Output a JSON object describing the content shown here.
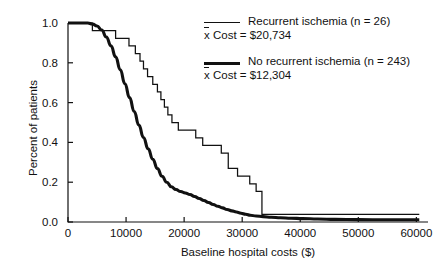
{
  "chart_data": {
    "type": "line",
    "title": "",
    "xlabel": "Baseline hospital costs ($)",
    "ylabel": "Percent of patients",
    "xlim": [
      0,
      62000
    ],
    "ylim": [
      0.0,
      1.0
    ],
    "grid": false,
    "legend_position": "top-right",
    "xticks": [
      "0",
      "10000",
      "20000",
      "30000",
      "40000",
      "50000",
      "60000"
    ],
    "xtick_values": [
      0,
      10000,
      20000,
      30000,
      40000,
      50000,
      60000
    ],
    "yticks": [
      "0.0",
      "0.2",
      "0.4",
      "0.6",
      "0.8",
      "1.0"
    ],
    "ytick_values": [
      0.0,
      0.2,
      0.4,
      0.6,
      0.8,
      1.0
    ],
    "series": [
      {
        "name": "Recurrent ischemia (n = 26)",
        "n": 26,
        "mean_cost": "$20,734",
        "style": "step",
        "linewidth": "thin",
        "color": "#111111",
        "points": [
          [
            0,
            1.0
          ],
          [
            4200,
            1.0
          ],
          [
            4200,
            0.962
          ],
          [
            8200,
            0.962
          ],
          [
            8200,
            0.923
          ],
          [
            10500,
            0.923
          ],
          [
            10500,
            0.885
          ],
          [
            11600,
            0.885
          ],
          [
            11600,
            0.846
          ],
          [
            12400,
            0.846
          ],
          [
            12400,
            0.808
          ],
          [
            13000,
            0.808
          ],
          [
            13000,
            0.769
          ],
          [
            13700,
            0.769
          ],
          [
            13700,
            0.731
          ],
          [
            14600,
            0.731
          ],
          [
            14600,
            0.692
          ],
          [
            15400,
            0.692
          ],
          [
            15400,
            0.654
          ],
          [
            16000,
            0.654
          ],
          [
            16000,
            0.615
          ],
          [
            16600,
            0.615
          ],
          [
            16600,
            0.577
          ],
          [
            17200,
            0.577
          ],
          [
            17200,
            0.538
          ],
          [
            17900,
            0.538
          ],
          [
            17900,
            0.5
          ],
          [
            19000,
            0.5
          ],
          [
            19000,
            0.462
          ],
          [
            22000,
            0.462
          ],
          [
            22000,
            0.423
          ],
          [
            23200,
            0.423
          ],
          [
            23200,
            0.385
          ],
          [
            26400,
            0.385
          ],
          [
            26400,
            0.346
          ],
          [
            27600,
            0.346
          ],
          [
            27600,
            0.269
          ],
          [
            29200,
            0.269
          ],
          [
            29200,
            0.231
          ],
          [
            31300,
            0.231
          ],
          [
            31300,
            0.192
          ],
          [
            32400,
            0.192
          ],
          [
            32400,
            0.154
          ],
          [
            33400,
            0.154
          ],
          [
            33400,
            0.038
          ],
          [
            60500,
            0.038
          ]
        ]
      },
      {
        "name": "No recurrent ischemia (n = 243)",
        "n": 243,
        "mean_cost": "$12,304",
        "style": "smooth-step",
        "linewidth": "thick",
        "color": "#111111",
        "points": [
          [
            0,
            1.0
          ],
          [
            3400,
            1.0
          ],
          [
            4200,
            0.995
          ],
          [
            5000,
            0.985
          ],
          [
            5800,
            0.965
          ],
          [
            6600,
            0.93
          ],
          [
            7400,
            0.885
          ],
          [
            8200,
            0.83
          ],
          [
            9000,
            0.765
          ],
          [
            9800,
            0.695
          ],
          [
            10600,
            0.625
          ],
          [
            11400,
            0.555
          ],
          [
            12200,
            0.487
          ],
          [
            13000,
            0.425
          ],
          [
            13800,
            0.368
          ],
          [
            14600,
            0.315
          ],
          [
            15400,
            0.268
          ],
          [
            16200,
            0.23
          ],
          [
            17000,
            0.2
          ],
          [
            17800,
            0.177
          ],
          [
            18600,
            0.163
          ],
          [
            19400,
            0.153
          ],
          [
            20200,
            0.146
          ],
          [
            21000,
            0.138
          ],
          [
            21800,
            0.128
          ],
          [
            22600,
            0.118
          ],
          [
            23400,
            0.108
          ],
          [
            24200,
            0.098
          ],
          [
            25000,
            0.088
          ],
          [
            25800,
            0.079
          ],
          [
            26600,
            0.071
          ],
          [
            27400,
            0.063
          ],
          [
            28200,
            0.056
          ],
          [
            29000,
            0.05
          ],
          [
            29800,
            0.044
          ],
          [
            30600,
            0.039
          ],
          [
            31400,
            0.034
          ],
          [
            32400,
            0.03
          ],
          [
            33600,
            0.027
          ],
          [
            35000,
            0.024
          ],
          [
            36600,
            0.021
          ],
          [
            38400,
            0.019
          ],
          [
            40400,
            0.017
          ],
          [
            43000,
            0.015
          ],
          [
            46000,
            0.013
          ],
          [
            50000,
            0.012
          ],
          [
            55000,
            0.011
          ],
          [
            60500,
            0.011
          ]
        ]
      }
    ]
  },
  "legend": {
    "entries": [
      {
        "label": "Recurrent ischemia (n = 26)",
        "cost_prefix": "x",
        "cost_text": " Cost = $20,734",
        "swatch": "thin-line-swatch"
      },
      {
        "label": "No recurrent ischemia (n = 243)",
        "cost_prefix": "x",
        "cost_text": " Cost = $12,304",
        "swatch": "thick-line-swatch"
      }
    ]
  },
  "axes": {
    "x_label": "Baseline hospital costs ($)",
    "y_label": "Percent of patients"
  },
  "colors": {
    "line": "#111111",
    "background": "#ffffff",
    "axis": "#111111"
  }
}
